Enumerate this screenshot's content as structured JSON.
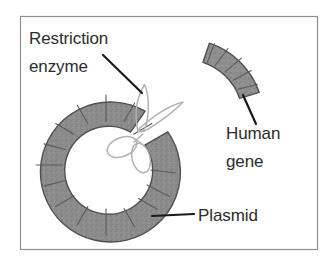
{
  "figure": {
    "background_color": "#ffffff",
    "border": {
      "color": "#8f8f8f",
      "width_px": 1,
      "x": 20,
      "y": 16,
      "width": 298,
      "height": 234
    }
  },
  "labels": {
    "restriction_enzyme": {
      "line1": "Restriction",
      "line2": "enzyme"
    },
    "human_gene": {
      "line1": "Human",
      "line2": "gene"
    },
    "plasmid": {
      "text": "Plasmid"
    }
  },
  "colors": {
    "text": "#2c2c2c",
    "dna_fill": "#8a8a8a",
    "dna_stroke": "#4a4a4a",
    "segment_divider": "#5a5a5a",
    "scissors_stroke": "#b0b0b0",
    "leader_line": "#1a1a1a",
    "border": "#8f8f8f"
  },
  "shapes": {
    "plasmid": {
      "kind": "segmented-ring-with-gap",
      "center_x": 106,
      "center_y": 165,
      "outer_radius": 70,
      "inner_radius": 44,
      "gap_start_deg": -76,
      "gap_end_deg": -28,
      "segment_count": 15
    },
    "human_gene": {
      "kind": "segmented-arc",
      "center_x": 185,
      "center_y": 118,
      "outer_radius": 79,
      "inner_radius": 58,
      "start_deg": -72,
      "end_deg": -20,
      "segment_count": 5
    },
    "scissors": {
      "kind": "line-art-scissors",
      "pivot_x": 138,
      "pivot_y": 131
    }
  },
  "leader_lines": {
    "restriction_enzyme": {
      "x1": 103,
      "y1": 55,
      "x2": 142,
      "y2": 93
    },
    "human_gene": {
      "x1": 243,
      "y1": 95,
      "x2": 256,
      "y2": 124
    },
    "plasmid": {
      "x1": 152,
      "y1": 216,
      "x2": 194,
      "y2": 214
    }
  }
}
